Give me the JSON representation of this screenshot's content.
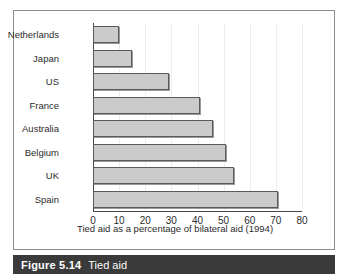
{
  "figure": {
    "number_label": "Figure 5.14",
    "title": "Tied aid",
    "caption_bar_color": "#3a3a3a",
    "caption_text_color": "#ffffff"
  },
  "chart_data": {
    "type": "bar",
    "orientation": "horizontal",
    "title": "",
    "xlabel": "Tied aid as a percentage of bilateral aid (1994)",
    "ylabel": "",
    "categories": [
      "Netherlands",
      "Japan",
      "US",
      "France",
      "Australia",
      "Belgium",
      "UK",
      "Spain"
    ],
    "values": [
      10,
      15,
      29,
      41,
      46,
      51,
      54,
      71
    ],
    "xlim": [
      0,
      80
    ],
    "xticks": [
      0,
      10,
      20,
      30,
      40,
      50,
      60,
      70,
      80
    ],
    "xtick_labels": [
      "0",
      "10",
      "20",
      "30",
      "40",
      "50",
      "60",
      "70",
      "80"
    ],
    "grid": true,
    "legend": false,
    "bar_fill_color": "#cbcbcb",
    "bar_border_color": "#5a5a5a",
    "axis_color": "#4a4a4a",
    "frame_color": "#8c8c8c"
  }
}
